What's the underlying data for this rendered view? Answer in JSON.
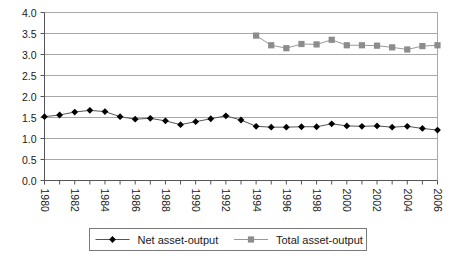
{
  "chart_data": {
    "type": "line",
    "title": "",
    "xlabel": "",
    "ylabel": "",
    "x": [
      1980,
      1981,
      1982,
      1983,
      1984,
      1985,
      1986,
      1987,
      1988,
      1989,
      1990,
      1991,
      1992,
      1993,
      1994,
      1995,
      1996,
      1997,
      1998,
      1999,
      2000,
      2001,
      2002,
      2003,
      2004,
      2005,
      2006
    ],
    "xlim": [
      1980,
      2006
    ],
    "ylim": [
      0.0,
      4.0
    ],
    "yticks": [
      0.0,
      0.5,
      1.0,
      1.5,
      2.0,
      2.5,
      3.0,
      3.5,
      4.0
    ],
    "ytick_labels": [
      "0.0",
      "0.5",
      "1.0",
      "1.5",
      "2.0",
      "2.5",
      "3.0",
      "3.5",
      "4.0"
    ],
    "xticks": [
      1980,
      1982,
      1984,
      1986,
      1988,
      1990,
      1992,
      1994,
      1996,
      1998,
      2000,
      2002,
      2004,
      2006
    ],
    "xtick_labels": [
      "1980",
      "1982",
      "1984",
      "1986",
      "1988",
      "1990",
      "1992",
      "1994",
      "1996",
      "1998",
      "2000",
      "2002",
      "2004",
      "2006"
    ],
    "xtick_rotation": 90,
    "grid": "horizontal",
    "legend_position": "bottom",
    "series": [
      {
        "name": "Net asset-output",
        "marker": "diamond",
        "color": "#000000",
        "line_color": "#555555",
        "values": [
          1.52,
          1.56,
          1.63,
          1.67,
          1.64,
          1.52,
          1.46,
          1.48,
          1.42,
          1.33,
          1.4,
          1.47,
          1.54,
          1.44,
          1.29,
          1.27,
          1.27,
          1.28,
          1.28,
          1.35,
          1.3,
          1.29,
          1.3,
          1.27,
          1.29,
          1.24,
          1.2
        ]
      },
      {
        "name": "Total asset-output",
        "marker": "square",
        "color": "#8c8c8c",
        "line_color": "#999999",
        "values": [
          null,
          null,
          null,
          null,
          null,
          null,
          null,
          null,
          null,
          null,
          null,
          null,
          null,
          null,
          3.45,
          3.22,
          3.15,
          3.25,
          3.24,
          3.35,
          3.22,
          3.22,
          3.21,
          3.17,
          3.12,
          3.2,
          3.22
        ]
      }
    ]
  },
  "legend": {
    "entries": [
      {
        "label": "Net asset-output",
        "marker": "diamond-marker",
        "color": "#000000"
      },
      {
        "label": "Total asset-output",
        "marker": "square-marker",
        "color": "#8c8c8c"
      }
    ]
  },
  "colors": {
    "net_series": "#000000",
    "total_series": "#8c8c8c",
    "gridline": "#a8a8a8",
    "axis": "#555555",
    "text": "#1a1a1a",
    "background": "#ffffff"
  }
}
